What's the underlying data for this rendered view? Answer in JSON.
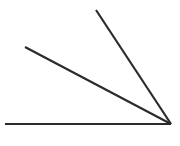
{
  "figure": {
    "background_color": "#ffffff",
    "stroke_color": "#2b2b2b",
    "stroke_width": 2.2,
    "canvas": {
      "width": 180,
      "height": 146
    },
    "vertex": {
      "label": "common-vertex",
      "x": 171,
      "y": 124
    },
    "rays": [
      {
        "name": "horizontal-ray",
        "label": "Horizontal base ray",
        "from_x": 171,
        "from_y": 124,
        "to_x": 5,
        "to_y": 124
      },
      {
        "name": "middle-ray",
        "label": "Middle slanted ray",
        "from_x": 171,
        "from_y": 124,
        "to_x": 25,
        "to_y": 47
      },
      {
        "name": "steep-ray",
        "label": "Steep upper ray",
        "from_x": 171,
        "from_y": 124,
        "to_x": 96,
        "to_y": 10
      }
    ]
  }
}
